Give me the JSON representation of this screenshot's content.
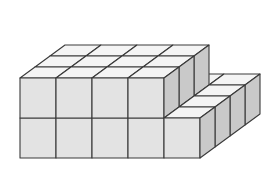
{
  "figure": {
    "name": "isometric-cube-stack",
    "background_color": "#ffffff"
  },
  "geometry": {
    "projection": "isometric",
    "grid_columns": 5,
    "grid_rows": 4,
    "max_height_layers": 2,
    "cube_width_px": 36,
    "cube_depth_dx_px": 15,
    "cube_depth_dy_px": -11,
    "cube_height_px": 40,
    "origin_x_px": 20,
    "origin_y_px": 158,
    "heights": [
      [
        2,
        2,
        2,
        2,
        1
      ],
      [
        2,
        2,
        2,
        2,
        1
      ],
      [
        2,
        2,
        2,
        2,
        1
      ],
      [
        1,
        1,
        1,
        1,
        1
      ]
    ]
  },
  "colors": {
    "top_face": "#f4f4f4",
    "front_face": "#e3e3e3",
    "right_face": "#c9c9c9",
    "edge_stroke": "#3a3a3a",
    "page_background": "#ffffff"
  },
  "counts": {
    "total_cubes": 35,
    "front_row_visible": 5,
    "upper_tier_columns": 4,
    "upper_tier_rows": 3
  }
}
